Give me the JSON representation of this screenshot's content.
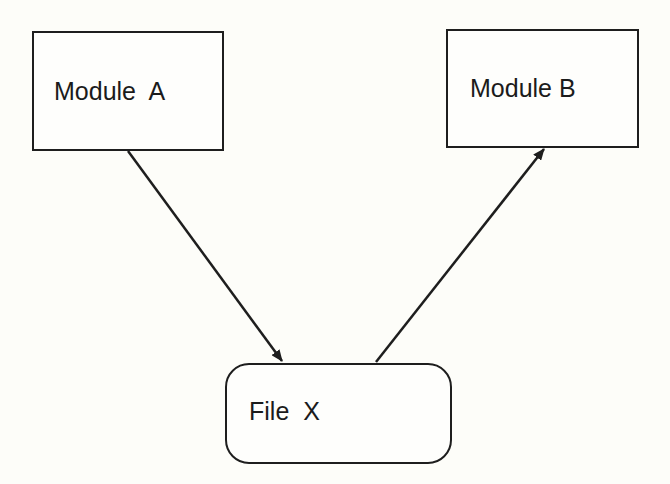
{
  "diagram": {
    "nodes": [
      {
        "id": "module-a",
        "label": "Module  A",
        "shape": "rectangle"
      },
      {
        "id": "module-b",
        "label": "Module B",
        "shape": "rectangle"
      },
      {
        "id": "file-x",
        "label": "File  X",
        "shape": "rounded-rectangle"
      }
    ],
    "edges": [
      {
        "from": "module-a",
        "to": "file-x",
        "style": "arrow"
      },
      {
        "from": "file-x",
        "to": "module-b",
        "style": "arrow"
      }
    ],
    "colors": {
      "stroke": "#1e1e1e",
      "background": "#fdfdf9"
    }
  }
}
